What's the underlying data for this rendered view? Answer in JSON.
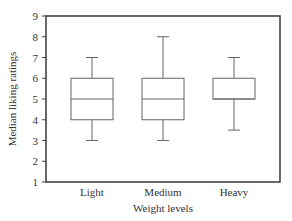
{
  "chart_data": {
    "type": "box",
    "title": "",
    "xlabel": "Weight levels",
    "ylabel": "Median liking ratings",
    "categories": [
      "Light",
      "Medium",
      "Heavy"
    ],
    "boxes": [
      {
        "name": "Light",
        "min": 3,
        "q1": 4,
        "median": 5,
        "q3": 6,
        "max": 7
      },
      {
        "name": "Medium",
        "min": 3,
        "q1": 4,
        "median": 5,
        "q3": 6,
        "max": 8
      },
      {
        "name": "Heavy",
        "min": 3.5,
        "q1": 5,
        "median": 5,
        "q3": 6,
        "max": 7
      }
    ],
    "ylim": [
      1,
      9
    ],
    "yticks": [
      1,
      2,
      3,
      4,
      5,
      6,
      7,
      8,
      9
    ],
    "grid": false,
    "legend": null
  },
  "colors": {
    "axis": "#444444",
    "box": "#666666"
  }
}
